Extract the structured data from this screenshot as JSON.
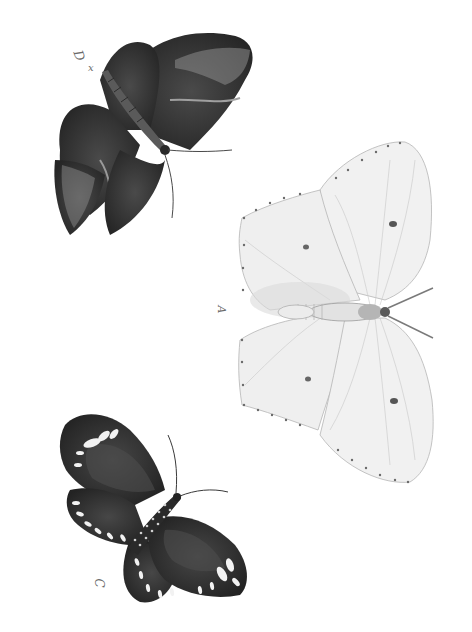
{
  "plate": {
    "background": "#ffffff",
    "style": "grayscale engraving",
    "orientation": "rotated 90 degrees"
  },
  "specimens": [
    {
      "id": "D",
      "label": "D",
      "mark": "x",
      "description": "dark moth-like butterfly with pale hooked wingtips and pale submarginal band",
      "body_color": "#3a3a3a",
      "wing_color": "#2e2e2e",
      "accent_color": "#9a9a9a"
    },
    {
      "id": "A",
      "label": "A",
      "description": "pale brimstone-like butterfly with small dark discal spots and dotted margins",
      "wing_color": "#eeeeee",
      "spot_color": "#555555"
    },
    {
      "id": "C",
      "label": "C",
      "description": "dark butterfly with white spots along wing margins and spotted thorax",
      "wing_color": "#2a2a2a",
      "spot_color": "#f2f2f2"
    }
  ]
}
